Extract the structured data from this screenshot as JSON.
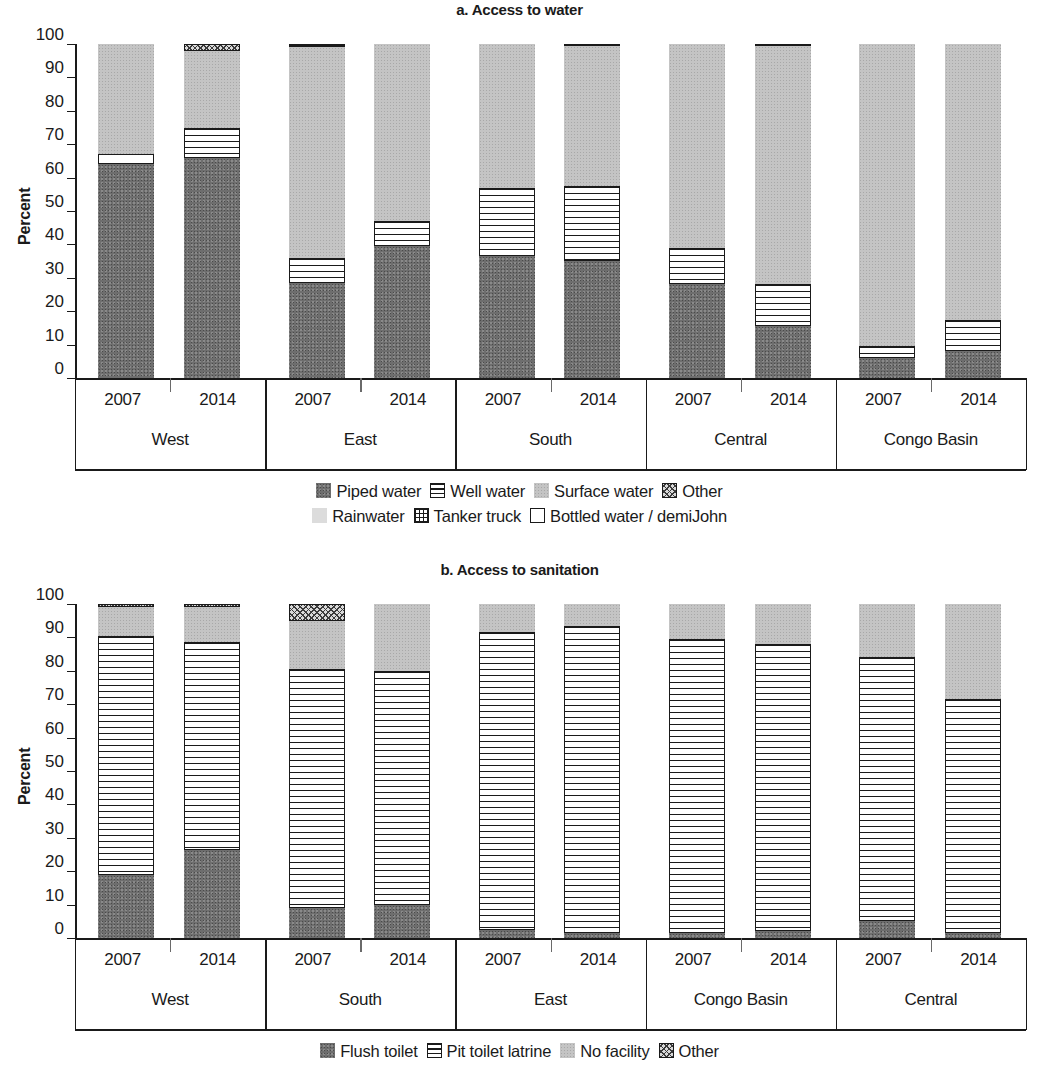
{
  "panel_a": {
    "title": "a. Access to water",
    "ylabel": "Percent",
    "yticks": [
      "100",
      "90",
      "80",
      "70",
      "60",
      "50",
      "40",
      "30",
      "20",
      "10",
      "0"
    ],
    "groups": [
      {
        "region": "West",
        "years": [
          "2007",
          "2014"
        ]
      },
      {
        "region": "East",
        "years": [
          "2007",
          "2014"
        ]
      },
      {
        "region": "South",
        "years": [
          "2007",
          "2014"
        ]
      },
      {
        "region": "Central",
        "years": [
          "2007",
          "2014"
        ]
      },
      {
        "region": "Congo Basin",
        "years": [
          "2007",
          "2014"
        ]
      }
    ],
    "legend_row1": [
      {
        "label": "Piped water",
        "pattern": "f-dark"
      },
      {
        "label": "Well water",
        "pattern": "f-hlines"
      },
      {
        "label": "Surface water",
        "pattern": "f-light"
      },
      {
        "label": "Other",
        "pattern": "f-diag"
      }
    ],
    "legend_row2": [
      {
        "label": "Rainwater",
        "pattern": "f-vlight"
      },
      {
        "label": "Tanker truck",
        "pattern": "f-cross"
      },
      {
        "label": "Bottled water / demiJohn",
        "pattern": "f-white"
      }
    ]
  },
  "panel_b": {
    "title": "b. Access to sanitation",
    "ylabel": "Percent",
    "yticks": [
      "100",
      "90",
      "80",
      "70",
      "60",
      "50",
      "40",
      "30",
      "20",
      "10",
      "0"
    ],
    "groups": [
      {
        "region": "West",
        "years": [
          "2007",
          "2014"
        ]
      },
      {
        "region": "South",
        "years": [
          "2007",
          "2014"
        ]
      },
      {
        "region": "East",
        "years": [
          "2007",
          "2014"
        ]
      },
      {
        "region": "Congo Basin",
        "years": [
          "2007",
          "2014"
        ]
      },
      {
        "region": "Central",
        "years": [
          "2007",
          "2014"
        ]
      }
    ],
    "legend_row1": [
      {
        "label": "Flush toilet",
        "pattern": "f-dark"
      },
      {
        "label": "Pit toilet latrine",
        "pattern": "f-hlines"
      },
      {
        "label": "No facility",
        "pattern": "f-light"
      },
      {
        "label": "Other",
        "pattern": "f-diag"
      }
    ]
  },
  "chart_data": [
    {
      "type": "bar",
      "subtype": "stacked-vertical",
      "title": "a. Access to water",
      "xlabel": "",
      "ylabel": "Percent",
      "ylim": [
        0,
        100
      ],
      "yticks": [
        0,
        10,
        20,
        30,
        40,
        50,
        60,
        70,
        80,
        90,
        100
      ],
      "grid": false,
      "legend_position": "below-plot",
      "categories": [
        "West 2007",
        "West 2014",
        "East 2007",
        "East 2014",
        "South 2007",
        "South 2014",
        "Central 2007",
        "Central 2014",
        "Congo Basin 2007",
        "Congo Basin 2014"
      ],
      "series": [
        {
          "name": "Piped water",
          "pattern": "f-dark",
          "values": [
            64.0,
            66.0,
            28.5,
            39.5,
            36.5,
            35.5,
            28.0,
            15.5,
            6.0,
            8.0
          ]
        },
        {
          "name": "Bottled water / demiJohn",
          "pattern": "f-white",
          "values": [
            3.0,
            0.0,
            0.0,
            0.0,
            0.0,
            0.0,
            0.0,
            0.0,
            0.0,
            0.0
          ]
        },
        {
          "name": "Well water",
          "pattern": "f-hlines",
          "values": [
            0.0,
            9.0,
            7.5,
            7.5,
            20.5,
            22.5,
            11.0,
            12.5,
            3.5,
            9.5
          ]
        },
        {
          "name": "Surface water",
          "pattern": "f-light",
          "values": [
            33.0,
            23.0,
            63.0,
            53.0,
            43.0,
            42.5,
            61.0,
            71.5,
            90.5,
            82.5
          ]
        },
        {
          "name": "Other",
          "pattern": "f-diag",
          "values": [
            0.0,
            2.0,
            0.0,
            0.0,
            0.0,
            0.0,
            0.0,
            0.0,
            0.0,
            0.0
          ]
        },
        {
          "name": "Tanker truck",
          "pattern": "f-black",
          "values": [
            0.0,
            0.0,
            1.0,
            0.0,
            0.0,
            0.5,
            0.0,
            0.5,
            0.0,
            0.0
          ]
        }
      ]
    },
    {
      "type": "bar",
      "subtype": "stacked-vertical",
      "title": "b. Access to sanitation",
      "xlabel": "",
      "ylabel": "Percent",
      "ylim": [
        0,
        100
      ],
      "yticks": [
        0,
        10,
        20,
        30,
        40,
        50,
        60,
        70,
        80,
        90,
        100
      ],
      "grid": false,
      "legend_position": "below-plot",
      "categories": [
        "West 2007",
        "West 2014",
        "South 2007",
        "South 2014",
        "East 2007",
        "East 2014",
        "Congo Basin 2007",
        "Congo Basin 2014",
        "Central 2007",
        "Central 2014"
      ],
      "series": [
        {
          "name": "Flush toilet",
          "pattern": "f-dark",
          "values": [
            19.0,
            26.5,
            9.0,
            10.0,
            2.5,
            1.5,
            1.5,
            2.0,
            5.0,
            1.5
          ]
        },
        {
          "name": "Pit toilet latrine",
          "pattern": "f-hlines",
          "values": [
            71.5,
            62.0,
            71.5,
            70.0,
            89.0,
            92.0,
            88.0,
            86.0,
            79.0,
            70.0
          ]
        },
        {
          "name": "No facility",
          "pattern": "f-light",
          "values": [
            8.5,
            10.5,
            14.5,
            20.0,
            8.5,
            6.5,
            10.5,
            12.0,
            16.0,
            28.5
          ]
        },
        {
          "name": "Other",
          "pattern": "f-diag",
          "values": [
            1.0,
            1.0,
            5.0,
            0.0,
            0.0,
            0.0,
            0.0,
            0.0,
            0.0,
            0.0
          ]
        }
      ]
    }
  ]
}
